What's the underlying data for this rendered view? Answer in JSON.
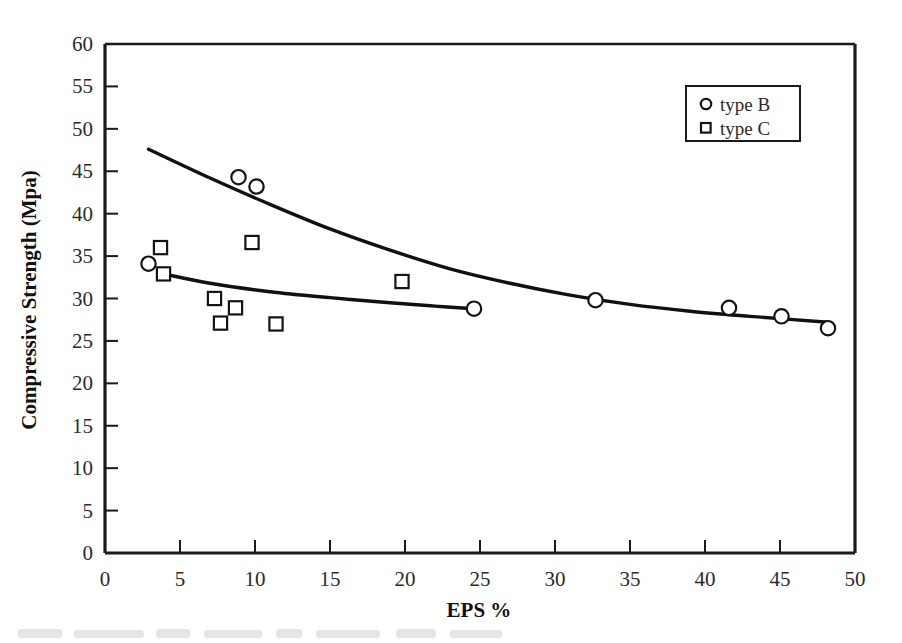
{
  "chart_data": {
    "type": "scatter",
    "title": "",
    "subtitle": "",
    "xlabel": "EPS %",
    "ylabel": "Compressive Strength (Mpa)",
    "xlim": [
      0,
      50
    ],
    "ylim": [
      0,
      60
    ],
    "xticks": [
      0,
      5,
      10,
      15,
      20,
      25,
      30,
      35,
      40,
      45,
      50
    ],
    "xticklabels": [
      "0",
      "5",
      "10",
      "15",
      "20",
      "25",
      "30",
      "35",
      "40",
      "45",
      "50"
    ],
    "yticks": [
      0,
      5,
      10,
      15,
      20,
      25,
      30,
      35,
      40,
      45,
      50,
      55,
      60
    ],
    "yticklabels": [
      "0",
      "5",
      "10",
      "15",
      "20",
      "25",
      "30",
      "35",
      "40",
      "45",
      "50",
      "55",
      "60"
    ],
    "grid": false,
    "legend_position": "upper right",
    "series": [
      {
        "name": "type B",
        "marker": "circle",
        "points": [
          {
            "x": 2.9,
            "y": 34.1
          },
          {
            "x": 8.9,
            "y": 44.3
          },
          {
            "x": 10.1,
            "y": 43.2
          },
          {
            "x": 24.6,
            "y": 28.8
          },
          {
            "x": 32.7,
            "y": 29.8
          },
          {
            "x": 41.6,
            "y": 28.9
          },
          {
            "x": 45.1,
            "y": 27.9
          },
          {
            "x": 48.2,
            "y": 26.5
          }
        ]
      },
      {
        "name": "type C",
        "marker": "square",
        "points": [
          {
            "x": 3.7,
            "y": 36.0
          },
          {
            "x": 3.9,
            "y": 32.9
          },
          {
            "x": 7.3,
            "y": 30.0
          },
          {
            "x": 8.7,
            "y": 28.9
          },
          {
            "x": 7.7,
            "y": 27.1
          },
          {
            "x": 9.8,
            "y": 36.6
          },
          {
            "x": 11.4,
            "y": 27.0
          },
          {
            "x": 19.8,
            "y": 32.0
          }
        ]
      }
    ],
    "trend_curves": [
      {
        "name": "type B trend",
        "points": [
          {
            "x": 2.9,
            "y": 47.6
          },
          {
            "x": 7.0,
            "y": 44.2
          },
          {
            "x": 11.0,
            "y": 41.1
          },
          {
            "x": 15.0,
            "y": 38.2
          },
          {
            "x": 19.0,
            "y": 35.7
          },
          {
            "x": 23.0,
            "y": 33.5
          },
          {
            "x": 27.0,
            "y": 31.8
          },
          {
            "x": 31.0,
            "y": 30.4
          },
          {
            "x": 35.0,
            "y": 29.3
          },
          {
            "x": 39.0,
            "y": 28.5
          },
          {
            "x": 43.0,
            "y": 27.9
          },
          {
            "x": 48.2,
            "y": 27.2
          }
        ]
      },
      {
        "name": "type C trend",
        "points": [
          {
            "x": 3.9,
            "y": 32.9
          },
          {
            "x": 7.0,
            "y": 31.8
          },
          {
            "x": 11.0,
            "y": 30.8
          },
          {
            "x": 15.0,
            "y": 30.1
          },
          {
            "x": 19.0,
            "y": 29.5
          },
          {
            "x": 22.0,
            "y": 29.1
          },
          {
            "x": 24.6,
            "y": 28.8
          }
        ]
      }
    ]
  },
  "legend": {
    "entries": [
      {
        "label": "type B",
        "marker": "circle-marker"
      },
      {
        "label": "type C",
        "marker": "square-marker"
      }
    ]
  },
  "axes": {
    "x_title": "EPS %",
    "y_title": "Compressive Strength (Mpa)"
  }
}
